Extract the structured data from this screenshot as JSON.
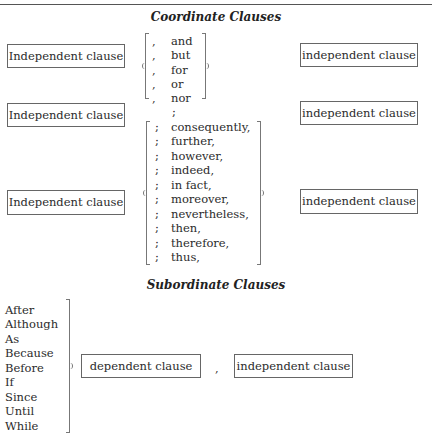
{
  "coordinate": {
    "heading": "Coordinate Clauses",
    "rows": [
      {
        "left": "Independent clause",
        "right": "independent clause"
      },
      {
        "left": "Independent clause",
        "right": "independent clause"
      },
      {
        "left": "Independent clause",
        "right": "independent clause"
      }
    ],
    "conjunctions": [
      {
        "punct": ",",
        "word": "and"
      },
      {
        "punct": ",",
        "word": "but"
      },
      {
        "punct": ",",
        "word": "for"
      },
      {
        "punct": ",",
        "word": "or"
      },
      {
        "punct": ",",
        "word": "nor"
      }
    ],
    "semicolon_alone": ";",
    "conjunctive_adverbs": [
      {
        "punct": ";",
        "word": "consequently,"
      },
      {
        "punct": ";",
        "word": "further,"
      },
      {
        "punct": ";",
        "word": "however,"
      },
      {
        "punct": ";",
        "word": "indeed,"
      },
      {
        "punct": ";",
        "word": "in fact,"
      },
      {
        "punct": ";",
        "word": "moreover,"
      },
      {
        "punct": ";",
        "word": "nevertheless,"
      },
      {
        "punct": ";",
        "word": "then,"
      },
      {
        "punct": ";",
        "word": "therefore,"
      },
      {
        "punct": ";",
        "word": "thus,"
      }
    ]
  },
  "subordinate": {
    "heading": "Subordinate Clauses",
    "subordinators": [
      "After",
      "Although",
      "As",
      "Because",
      "Before",
      "If",
      "Since",
      "Until",
      "While"
    ],
    "dependent_box": "dependent clause",
    "comma": ",",
    "independent_box": "independent clause"
  }
}
